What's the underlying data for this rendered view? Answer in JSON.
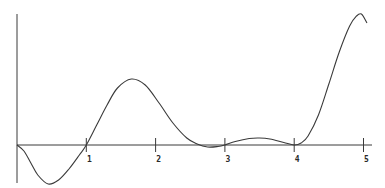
{
  "chart_data": {
    "type": "line",
    "title": "",
    "xlabel": "",
    "ylabel": "",
    "xlim": [
      0,
      5.1
    ],
    "ylim": [
      -4,
      13.2
    ],
    "grid": false,
    "legend": null,
    "x_ticks": [
      1,
      2,
      3,
      4,
      5
    ],
    "x_tick_labels": [
      "1",
      "2",
      "3",
      "4",
      "5"
    ],
    "series": [
      {
        "name": "curve",
        "color": "#3a3a3a",
        "x": [
          0,
          0.1,
          0.2,
          0.3,
          0.45,
          0.6,
          0.75,
          0.9,
          1.0,
          1.15,
          1.3,
          1.45,
          1.65,
          1.85,
          2.05,
          2.25,
          2.45,
          2.6,
          2.75,
          2.9,
          3.0,
          3.15,
          3.35,
          3.5,
          3.65,
          3.85,
          4.0,
          4.1,
          4.2,
          4.35,
          4.5,
          4.65,
          4.8,
          4.9,
          4.97,
          5.05
        ],
        "values": [
          0,
          -0.6,
          -1.8,
          -3.0,
          -3.9,
          -3.5,
          -2.4,
          -1.0,
          0,
          2.0,
          4.0,
          5.7,
          6.6,
          6.0,
          4.2,
          2.2,
          0.7,
          0.1,
          -0.2,
          -0.15,
          0,
          0.35,
          0.65,
          0.7,
          0.6,
          0.25,
          0,
          0.2,
          0.9,
          3.0,
          6.1,
          9.3,
          11.9,
          12.9,
          13.1,
          12.2
        ]
      }
    ]
  }
}
